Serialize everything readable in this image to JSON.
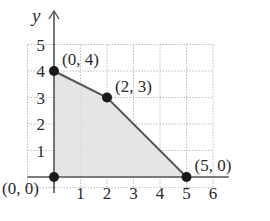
{
  "chart_data": {
    "type": "line",
    "title": "",
    "xlabel": "",
    "ylabel": "y",
    "xlim": [
      0,
      6
    ],
    "ylim": [
      0,
      5
    ],
    "x_ticks": [
      "1",
      "2",
      "3",
      "4",
      "5",
      "6"
    ],
    "y_ticks": [
      "1",
      "2",
      "3",
      "4",
      "5"
    ],
    "grid": true,
    "shaded_region": {
      "vertices": [
        [
          0,
          0
        ],
        [
          0,
          4
        ],
        [
          2,
          3
        ],
        [
          5,
          0
        ]
      ],
      "fill": "#e0e0e0"
    },
    "points": [
      {
        "x": 0,
        "y": 0,
        "label": "(0, 0)"
      },
      {
        "x": 0,
        "y": 4,
        "label": "(0, 4)"
      },
      {
        "x": 2,
        "y": 3,
        "label": "(2, 3)"
      },
      {
        "x": 5,
        "y": 0,
        "label": "(5, 0)"
      }
    ]
  },
  "colors": {
    "axis": "#555555",
    "grid": "#bdbdbd",
    "boundary": "#555555",
    "point": "#1a1a1a",
    "fill": "#e0e0e0"
  }
}
